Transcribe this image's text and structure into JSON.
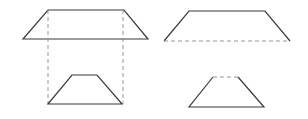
{
  "diagram": {
    "colors": {
      "line": "#3a3a3a",
      "dashed": "#8a8a8a",
      "background": "#ffffff"
    },
    "figures": [
      {
        "name": "left-projection",
        "large_trapezoid": {
          "top": [
            [
              48,
              10
            ],
            [
              124,
              10
            ]
          ],
          "bottom": [
            [
              23,
              39
            ],
            [
              148,
              39
            ]
          ],
          "style": "solid"
        },
        "projection_lines": [
          [
            [
              48,
              10
            ],
            [
              48,
              104
            ]
          ],
          [
            [
              123,
              10
            ],
            [
              123,
              104
            ]
          ]
        ],
        "small_trapezoid": {
          "top": [
            [
              72,
              75
            ],
            [
              97,
              75
            ]
          ],
          "bottom": [
            [
              48,
              104
            ],
            [
              122,
              104
            ]
          ],
          "style": "solid"
        }
      },
      {
        "name": "right-cut",
        "large_trapezoid": {
          "top": [
            [
              189,
              11
            ],
            [
              265,
              11
            ]
          ],
          "bottom": [
            [
              164,
              41
            ],
            [
              290,
              41
            ]
          ],
          "bottom_style": "dashed"
        },
        "small_trapezoid": {
          "top": [
            [
              213,
              77
            ],
            [
              238,
              77
            ]
          ],
          "bottom": [
            [
              189,
              107
            ],
            [
              264,
              107
            ]
          ],
          "top_style": "dashed"
        }
      }
    ]
  }
}
